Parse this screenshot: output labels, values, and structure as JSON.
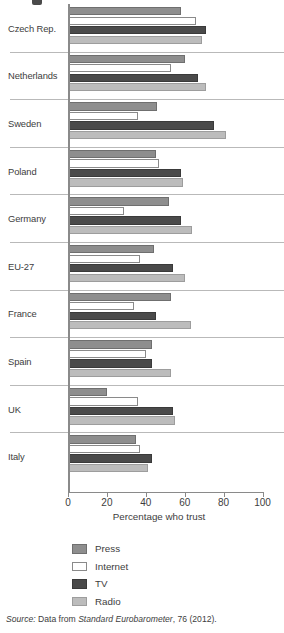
{
  "chart_data": {
    "type": "bar",
    "orientation": "horizontal",
    "title": "",
    "xlabel": "Percentage who trust",
    "ylabel": "",
    "xlim": [
      0,
      100
    ],
    "xticks": [
      0,
      20,
      40,
      60,
      80,
      100
    ],
    "grid": false,
    "legend_position": "bottom-left",
    "categories": [
      "Czech Rep.",
      "Netherlands",
      "Sweden",
      "Poland",
      "Germany",
      "EU-27",
      "France",
      "Spain",
      "UK",
      "Italy"
    ],
    "series": [
      {
        "name": "Press",
        "color": "#8e8e8e",
        "values": [
          58,
          60,
          46,
          45,
          52,
          44,
          53,
          43,
          20,
          35
        ]
      },
      {
        "name": "Internet",
        "color": "#ffffff",
        "values": [
          66,
          53,
          36,
          47,
          29,
          37,
          34,
          40,
          36,
          37
        ]
      },
      {
        "name": "TV",
        "color": "#4a4a4a",
        "values": [
          71,
          67,
          75,
          58,
          58,
          54,
          45,
          43,
          54,
          43
        ]
      },
      {
        "name": "Radio",
        "color": "#bcbcbc",
        "values": [
          69,
          71,
          81,
          59,
          64,
          60,
          63,
          53,
          55,
          41
        ]
      }
    ]
  },
  "legend": {
    "items": [
      {
        "label": "Press"
      },
      {
        "label": "Internet"
      },
      {
        "label": "TV"
      },
      {
        "label": "Radio"
      }
    ]
  },
  "source": {
    "prefix": "Source:",
    "text_before": "Data from",
    "publication": "Standard Eurobarometer",
    "text_after": ", 76 (2012)."
  }
}
